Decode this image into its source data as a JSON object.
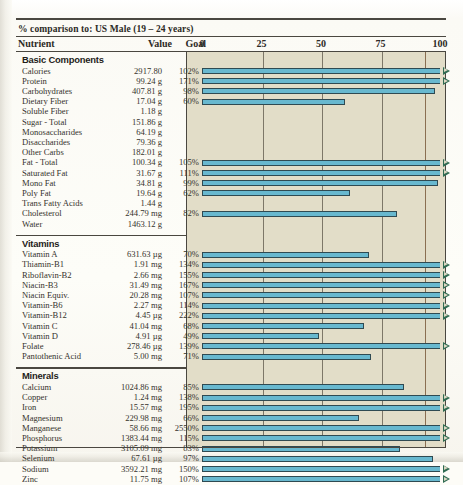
{
  "header": {
    "subtitle": "% comparison to: US Male (19 – 24 years)",
    "col_nutrient": "Nutrient",
    "col_value": "Value",
    "col_goal": "Goal %"
  },
  "colors": {
    "bar_fill": "#68b8cf",
    "bar_outline": "#2f4a52",
    "panel_bg": "#e2ddc8",
    "arrow": "#2f6b52",
    "rule": "#4a4740"
  },
  "chart_data": {
    "type": "bar",
    "orientation": "horizontal",
    "title": "% comparison to: US Male (19 – 24 years)",
    "xlabel": "",
    "ylabel": "",
    "xlim": [
      0,
      100
    ],
    "xticks": [
      0,
      25,
      50,
      75,
      100
    ],
    "xtick_labels": [
      "0",
      "25",
      "50",
      "75",
      "100"
    ],
    "grid": true,
    "legend": false,
    "note": "Bars are clipped at 100%; an open triangle marker at the right edge denotes values exceeding 100%.",
    "sections": [
      {
        "name": "Basic Components",
        "rows": [
          {
            "nutrient": "Calories",
            "value": "2917.80",
            "goal": "102%",
            "pct": 102
          },
          {
            "nutrient": "Protein",
            "value": "99.24 g",
            "goal": "171%",
            "pct": 171
          },
          {
            "nutrient": "Carbohydrates",
            "value": "407.81 g",
            "goal": "98%",
            "pct": 98
          },
          {
            "nutrient": "Dietary Fiber",
            "value": "17.04 g",
            "goal": "60%",
            "pct": 60
          },
          {
            "nutrient": "Soluble Fiber",
            "value": "1.18 g",
            "goal": "",
            "pct": null
          },
          {
            "nutrient": "Sugar - Total",
            "value": "151.86 g",
            "goal": "",
            "pct": null
          },
          {
            "nutrient": "Monosaccharides",
            "value": "64.19 g",
            "goal": "",
            "pct": null
          },
          {
            "nutrient": "Disaccharides",
            "value": "79.36 g",
            "goal": "",
            "pct": null
          },
          {
            "nutrient": "Other Carbs",
            "value": "182.01 g",
            "goal": "",
            "pct": null
          },
          {
            "nutrient": "Fat - Total",
            "value": "100.34 g",
            "goal": "105%",
            "pct": 105
          },
          {
            "nutrient": "Saturated Fat",
            "value": "31.67 g",
            "goal": "111%",
            "pct": 111
          },
          {
            "nutrient": "Mono Fat",
            "value": "34.81 g",
            "goal": "99%",
            "pct": 99
          },
          {
            "nutrient": "Poly Fat",
            "value": "19.64 g",
            "goal": "62%",
            "pct": 62
          },
          {
            "nutrient": "Trans Fatty Acids",
            "value": "1.44 g",
            "goal": "",
            "pct": null
          },
          {
            "nutrient": "Cholesterol",
            "value": "244.79 mg",
            "goal": "82%",
            "pct": 82
          },
          {
            "nutrient": "Water",
            "value": "1463.12 g",
            "goal": "",
            "pct": null
          }
        ]
      },
      {
        "name": "Vitamins",
        "rows": [
          {
            "nutrient": "Vitamin A",
            "value": "631.63 µg",
            "goal": "70%",
            "pct": 70
          },
          {
            "nutrient": "Thiamin-B1",
            "value": "1.91 mg",
            "goal": "134%",
            "pct": 134
          },
          {
            "nutrient": "Riboflavin-B2",
            "value": "2.66 mg",
            "goal": "155%",
            "pct": 155
          },
          {
            "nutrient": "Niacin-B3",
            "value": "31.49 mg",
            "goal": "167%",
            "pct": 167
          },
          {
            "nutrient": "Niacin Equiv.",
            "value": "20.28 mg",
            "goal": "107%",
            "pct": 107
          },
          {
            "nutrient": "Vitamin-B6",
            "value": "2.27 mg",
            "goal": "114%",
            "pct": 114
          },
          {
            "nutrient": "Vitamin-B12",
            "value": "4.45 µg",
            "goal": "222%",
            "pct": 222
          },
          {
            "nutrient": "Vitamin C",
            "value": "41.04 mg",
            "goal": "68%",
            "pct": 68
          },
          {
            "nutrient": "Vitamin D",
            "value": "4.91 µg",
            "goal": "49%",
            "pct": 49
          },
          {
            "nutrient": "Folate",
            "value": "278.46 µg",
            "goal": "139%",
            "pct": 139
          },
          {
            "nutrient": "Pantothenic Acid",
            "value": "5.00 mg",
            "goal": "71%",
            "pct": 71
          }
        ]
      },
      {
        "name": "Minerals",
        "rows": [
          {
            "nutrient": "Calcium",
            "value": "1024.86 mg",
            "goal": "85%",
            "pct": 85
          },
          {
            "nutrient": "Copper",
            "value": "1.24 mg",
            "goal": "138%",
            "pct": 138
          },
          {
            "nutrient": "Iron",
            "value": "15.57 mg",
            "goal": "195%",
            "pct": 195
          },
          {
            "nutrient": "Magnesium",
            "value": "229.98 mg",
            "goal": "66%",
            "pct": 66
          },
          {
            "nutrient": "Manganese",
            "value": "58.66 mg",
            "goal": "2550%",
            "pct": 2550
          },
          {
            "nutrient": "Phosphorus",
            "value": "1383.44 mg",
            "goal": "115%",
            "pct": 115
          },
          {
            "nutrient": "Potassium",
            "value": "3105.09 mg",
            "goal": "83%",
            "pct": 83
          },
          {
            "nutrient": "Selenium",
            "value": "67.61 µg",
            "goal": "97%",
            "pct": 97
          },
          {
            "nutrient": "Sodium",
            "value": "3592.21 mg",
            "goal": "150%",
            "pct": 150
          },
          {
            "nutrient": "Zinc",
            "value": "11.75 mg",
            "goal": "107%",
            "pct": 107
          }
        ]
      }
    ]
  }
}
